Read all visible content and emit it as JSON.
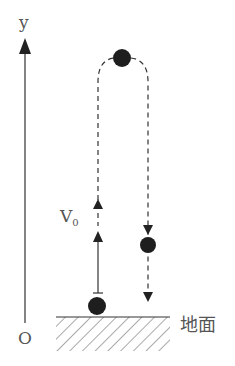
{
  "diagram": {
    "type": "physics-vertical-throw",
    "axis": {
      "y_label": "y",
      "origin_label": "O"
    },
    "velocity_label": "V",
    "velocity_subscript": "0",
    "ground_label": "地面",
    "colors": {
      "ink": "#222222",
      "label": "#555555",
      "ball": "#1e1e1e"
    },
    "elements": [
      {
        "id": "ball-ground",
        "description": "ball on ground at launch"
      },
      {
        "id": "ball-top",
        "description": "ball at highest point"
      },
      {
        "id": "ball-falling",
        "description": "ball falling on the way down"
      },
      {
        "id": "path-up",
        "description": "dashed upward path with arrow"
      },
      {
        "id": "path-down",
        "description": "dashed downward path with arrows"
      },
      {
        "id": "v0-arrow",
        "description": "initial velocity arrow upward"
      }
    ]
  }
}
